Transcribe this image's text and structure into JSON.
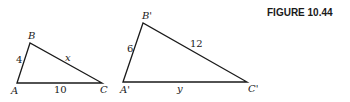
{
  "figure": {
    "caption": "FIGURE 10.44"
  },
  "triangles": [
    {
      "name": "ABC",
      "vertices": {
        "A": {
          "label": "A",
          "x": 17,
          "y": 83
        },
        "B": {
          "label": "B",
          "x": 30,
          "y": 43
        },
        "C": {
          "label": "C",
          "x": 102,
          "y": 83
        }
      },
      "sides": {
        "AB": "4",
        "BC": "x",
        "AC": "10"
      }
    },
    {
      "name": "A'B'C'",
      "vertices": {
        "A": {
          "label": "A'",
          "x": 123,
          "y": 82
        },
        "B": {
          "label": "B'",
          "x": 143,
          "y": 23
        },
        "C": {
          "label": "C'",
          "x": 247,
          "y": 82
        }
      },
      "sides": {
        "AB": "6",
        "BC": "12",
        "AC": "y"
      }
    }
  ],
  "colors": {
    "ink": "#1a1a1a",
    "background": "#ffffff"
  }
}
